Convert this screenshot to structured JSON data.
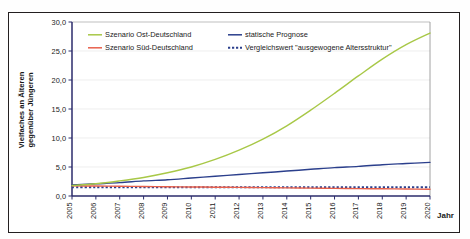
{
  "chart_data": {
    "type": "line",
    "title": "",
    "xlabel": "Jahr",
    "ylabel_line1": "Vielfaches an Älteren",
    "ylabel_line2": "gegenüber Jüngeren",
    "x": [
      2005,
      2006,
      2007,
      2008,
      2009,
      2010,
      2011,
      2012,
      2013,
      2014,
      2015,
      2016,
      2017,
      2018,
      2019,
      2020
    ],
    "xticklabels": [
      "2005",
      "2006",
      "2007",
      "2008",
      "2009",
      "2010",
      "2011",
      "2012",
      "2013",
      "2014",
      "2015",
      "2016",
      "2017",
      "2018",
      "2019",
      "2020"
    ],
    "yticks": [
      0,
      5,
      10,
      15,
      20,
      25,
      30
    ],
    "yticklabels": [
      "0,0",
      "5,0",
      "10,0",
      "15,0",
      "20,0",
      "25,0",
      "30,0"
    ],
    "ylim": [
      0,
      30
    ],
    "xlim": [
      2005,
      2020
    ],
    "grid": true,
    "legend_position": "top-inside",
    "series": [
      {
        "name": "Szenario Ost-Deutschland",
        "color": "#a8c847",
        "style": "solid",
        "values": [
          1.8,
          2.1,
          2.6,
          3.2,
          4.0,
          5.0,
          6.3,
          7.9,
          9.8,
          12.1,
          14.8,
          17.7,
          20.7,
          23.6,
          26.1,
          28.1
        ]
      },
      {
        "name": "Szenario Süd-Deutschland",
        "color": "#e8604c",
        "style": "solid",
        "values": [
          1.75,
          1.72,
          1.68,
          1.64,
          1.6,
          1.56,
          1.52,
          1.48,
          1.44,
          1.4,
          1.36,
          1.32,
          1.28,
          1.24,
          1.2,
          1.16
        ]
      },
      {
        "name": "statische Prognose",
        "color": "#2b3f8c",
        "style": "solid",
        "values": [
          1.9,
          2.1,
          2.3,
          2.6,
          2.8,
          3.1,
          3.4,
          3.7,
          4.0,
          4.3,
          4.6,
          4.9,
          5.1,
          5.4,
          5.6,
          5.8
        ]
      },
      {
        "name": "Vergleichswert \"ausgewogene Altersstruktur\"",
        "color": "#2b3f8c",
        "style": "dotted",
        "values": [
          1.5,
          1.5,
          1.5,
          1.5,
          1.5,
          1.5,
          1.5,
          1.5,
          1.5,
          1.5,
          1.5,
          1.5,
          1.5,
          1.5,
          1.5,
          1.5
        ]
      }
    ],
    "legend": [
      {
        "label": "Szenario Ost-Deutschland",
        "color": "#a8c847",
        "style": "solid"
      },
      {
        "label": "Szenario Süd-Deutschland",
        "color": "#e8604c",
        "style": "solid"
      },
      {
        "label": "statische Prognose",
        "color": "#2b3f8c",
        "style": "solid"
      },
      {
        "label": "Vergleichswert \"ausgewogene Altersstruktur\"",
        "color": "#2b3f8c",
        "style": "dotted"
      }
    ]
  }
}
